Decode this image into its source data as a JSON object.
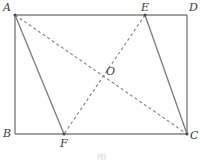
{
  "figure": {
    "caption": "图",
    "background_color": "#ffffff",
    "line_color": "#808080",
    "label_color": "#3a3a3a",
    "solid_stroke_width": 1.4,
    "dashed_stroke_width": 1.2,
    "dash_pattern": "3,2.6"
  },
  "points": [
    {
      "id": "A",
      "label": "A",
      "x": 15,
      "y": 15,
      "label_x": 3,
      "label_y": 2,
      "role": "rectangle-corner-top-left"
    },
    {
      "id": "D",
      "label": "D",
      "x": 187,
      "y": 15,
      "label_x": 189,
      "label_y": 2,
      "role": "rectangle-corner-top-right"
    },
    {
      "id": "B",
      "label": "B",
      "x": 15,
      "y": 134,
      "label_x": 3,
      "label_y": 128,
      "role": "rectangle-corner-bottom-left"
    },
    {
      "id": "C",
      "label": "C",
      "x": 187,
      "y": 134,
      "label_x": 189,
      "label_y": 130,
      "role": "rectangle-corner-bottom-right"
    },
    {
      "id": "E",
      "label": "E",
      "x": 145,
      "y": 15,
      "label_x": 141,
      "label_y": 2,
      "role": "point-on-top-edge"
    },
    {
      "id": "F",
      "label": "F",
      "x": 64,
      "y": 134,
      "label_x": 60,
      "label_y": 138,
      "role": "point-on-bottom-edge"
    },
    {
      "id": "O",
      "label": "O",
      "x": 102,
      "y": 74,
      "label_x": 106,
      "label_y": 66,
      "role": "diagonal-intersection"
    }
  ],
  "segments": [
    {
      "name": "rect-top-AD",
      "from": "A",
      "to": "D",
      "style": "solid"
    },
    {
      "name": "rect-right-DC",
      "from": "D",
      "to": "C",
      "style": "solid"
    },
    {
      "name": "rect-bottom-BC",
      "from": "B",
      "to": "C",
      "style": "solid"
    },
    {
      "name": "rect-left-AB",
      "from": "A",
      "to": "B",
      "style": "solid"
    },
    {
      "name": "segment-AF",
      "from": "A",
      "to": "F",
      "style": "solid"
    },
    {
      "name": "segment-EC",
      "from": "E",
      "to": "C",
      "style": "solid"
    },
    {
      "name": "diagonal-AC",
      "from": "A",
      "to": "C",
      "style": "dashed"
    },
    {
      "name": "diagonal-EF",
      "from": "E",
      "to": "F",
      "style": "dashed"
    }
  ]
}
